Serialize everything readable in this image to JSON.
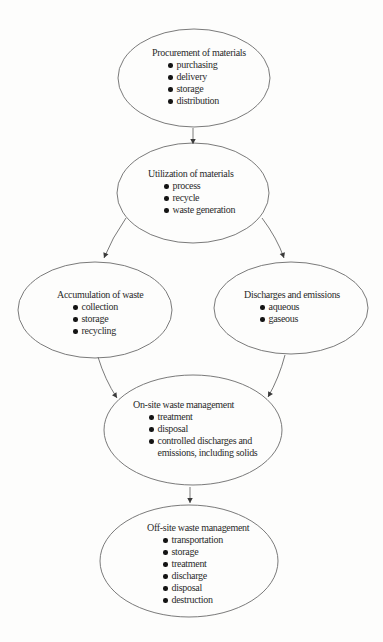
{
  "diagram": {
    "type": "flowchart",
    "nodes": [
      {
        "id": "procurement",
        "title": "Procurement of materials",
        "bullets": [
          "purchasing",
          "delivery",
          "storage",
          "distribution"
        ]
      },
      {
        "id": "utilization",
        "title": "Utilization of materials",
        "bullets": [
          "process",
          "recycle",
          "waste generation"
        ]
      },
      {
        "id": "accumulation",
        "title": "Accumulation of waste",
        "bullets": [
          "collection",
          "storage",
          "recycling"
        ]
      },
      {
        "id": "discharges",
        "title": "Discharges and emissions",
        "bullets": [
          "aqueous",
          "gaseous"
        ]
      },
      {
        "id": "onsite",
        "title": "On-site waste management",
        "bullets": [
          "treatment",
          "disposal",
          "controlled discharges and emissions, including solids"
        ]
      },
      {
        "id": "offsite",
        "title": "Off-site waste management",
        "bullets": [
          "transportation",
          "storage",
          "treatment",
          "discharge",
          "disposal",
          "destruction"
        ]
      }
    ],
    "edges": [
      {
        "from": "procurement",
        "to": "utilization"
      },
      {
        "from": "utilization",
        "to": "accumulation"
      },
      {
        "from": "utilization",
        "to": "discharges"
      },
      {
        "from": "accumulation",
        "to": "onsite"
      },
      {
        "from": "discharges",
        "to": "onsite"
      },
      {
        "from": "onsite",
        "to": "offsite"
      }
    ],
    "colors": {
      "background": "#fdfdfc",
      "text": "#2b2b2b",
      "outline": "#6b6b6b",
      "bullet": "#141414",
      "arrow": "#3a3a3a"
    }
  }
}
